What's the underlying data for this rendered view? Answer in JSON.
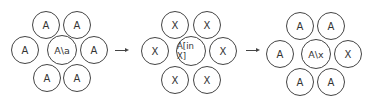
{
  "diagram": {
    "clusters": [
      {
        "name": "initial",
        "center": "A\\a",
        "neighbors": [
          "A",
          "A",
          "A",
          "A",
          "A",
          "A"
        ]
      },
      {
        "name": "intermediate",
        "center": "A[in X]",
        "neighbors": [
          "X",
          "X",
          "X",
          "X",
          "X",
          "X"
        ]
      },
      {
        "name": "final",
        "center": "A\\x",
        "neighbors": [
          "A",
          "A",
          "A",
          "X",
          "A",
          "A"
        ]
      }
    ],
    "arrows": [
      "→",
      "→"
    ],
    "colors": {
      "stroke": "#444444",
      "text": "#333333",
      "background": "#ffffff"
    }
  }
}
